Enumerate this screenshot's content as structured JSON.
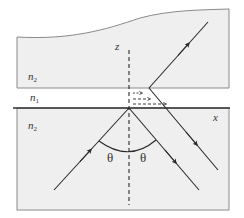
{
  "diagram": {
    "type": "optics-total-internal-reflection-goos-hanchen",
    "labels": {
      "upper_medium": "n",
      "upper_medium_sub": "2",
      "gap_medium": "n",
      "gap_medium_sub": "1",
      "lower_medium": "n",
      "lower_medium_sub": "2",
      "z_axis": "z",
      "x_axis": "x",
      "angle_left": "θ",
      "angle_right": "θ"
    },
    "colors": {
      "medium_fill": "#efefef",
      "border": "#888888",
      "line": "#2a2a2a",
      "interface": "#333333"
    }
  }
}
